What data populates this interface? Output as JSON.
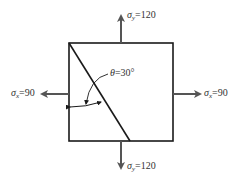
{
  "diagram": {
    "type": "stress element",
    "colors": {
      "element": "#1a1a1a",
      "arrow": "#555555",
      "text": "#333333"
    },
    "labels": {
      "sigma_y_top": {
        "symbol": "σ",
        "sub": "y",
        "value": "=120"
      },
      "sigma_y_bottom": {
        "symbol": "σ",
        "sub": "y",
        "value": "=120"
      },
      "sigma_x_left": {
        "symbol": "σ",
        "sub": "x",
        "value": "=90"
      },
      "sigma_x_right": {
        "symbol": "σ",
        "sub": "x",
        "value": "=90"
      },
      "theta": {
        "symbol": "θ",
        "value": "=30°"
      }
    }
  }
}
